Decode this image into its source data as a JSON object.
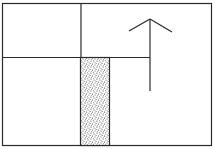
{
  "diagram": {
    "colors": {
      "line": "#2a2a2a",
      "fill_stipple": "#3a3a3a",
      "background": "#ffffff"
    },
    "elements": [
      {
        "name": "outer-frame",
        "type": "rectangle"
      },
      {
        "name": "divider-vertical",
        "type": "line"
      },
      {
        "name": "divider-horizontal",
        "type": "line"
      },
      {
        "name": "stippled-corridor",
        "type": "shaded-rectangle",
        "pattern": "stipple"
      },
      {
        "name": "up-arrow",
        "type": "arrow",
        "direction": "up"
      }
    ]
  }
}
